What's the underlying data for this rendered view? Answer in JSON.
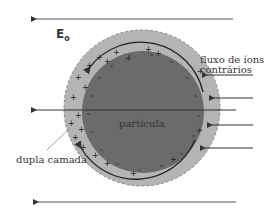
{
  "diagram": {
    "field_label": "E",
    "field_subscript": "o",
    "particle_label": "partícula",
    "double_layer_label": "dupla camada",
    "counterion_flow_label_line1": "fluxo de íons",
    "counterion_flow_label_line2": "contrários",
    "colors": {
      "particle": "#6b6b6b",
      "double_layer": "#b4b4b4",
      "arrows": "#333333"
    }
  }
}
